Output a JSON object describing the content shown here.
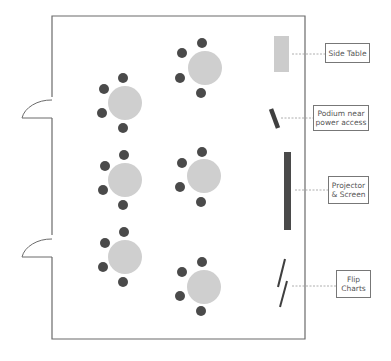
{
  "colors": {
    "wall": "#6b6b6b",
    "table": "#cfcfcf",
    "chair": "#4a4a4a",
    "side_table": "#cccccc",
    "equipment": "#4a4a4a",
    "leader": "#999999"
  },
  "room": {
    "x": 52,
    "y": 16,
    "width": 253,
    "height": 323
  },
  "doors": [
    {
      "y_top": 97,
      "y_bottom": 118
    },
    {
      "y_top": 235,
      "y_bottom": 257
    }
  ],
  "tables": [
    {
      "cx": 125,
      "cy": 103
    },
    {
      "cx": 205,
      "cy": 68
    },
    {
      "cx": 125,
      "cy": 180
    },
    {
      "cx": 204,
      "cy": 176
    },
    {
      "cx": 125,
      "cy": 257
    },
    {
      "cx": 204,
      "cy": 287
    }
  ],
  "labels": {
    "side_table": "Side Table",
    "podium": "Podium near\npower access",
    "projector": "Projector\n& Screen",
    "flip_charts": "Flip\nCharts"
  }
}
